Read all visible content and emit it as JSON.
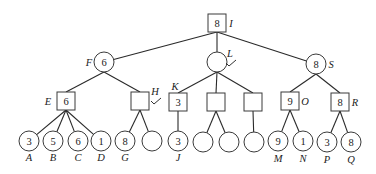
{
  "diagram": {
    "type": "game-tree",
    "edges": [
      [
        "I",
        "F"
      ],
      [
        "I",
        "L"
      ],
      [
        "I",
        "S"
      ],
      [
        "F",
        "E"
      ],
      [
        "F",
        "H"
      ],
      [
        "L",
        "K"
      ],
      [
        "L",
        "L2"
      ],
      [
        "L",
        "L3"
      ],
      [
        "S",
        "O"
      ],
      [
        "S",
        "R"
      ],
      [
        "E",
        "A"
      ],
      [
        "E",
        "B"
      ],
      [
        "E",
        "C"
      ],
      [
        "E",
        "D"
      ],
      [
        "H",
        "G"
      ],
      [
        "H",
        "H2"
      ],
      [
        "K",
        "J"
      ],
      [
        "L2",
        "L2a"
      ],
      [
        "L2",
        "L2b"
      ],
      [
        "L3",
        "L3a"
      ],
      [
        "O",
        "M"
      ],
      [
        "O",
        "N"
      ],
      [
        "R",
        "P"
      ],
      [
        "R",
        "Q"
      ]
    ],
    "nodes": {
      "I": {
        "shape": "square",
        "x": 217,
        "y": 23,
        "value": "8",
        "label": "I",
        "label_dx": 14,
        "label_dy": 0
      },
      "F": {
        "shape": "circle",
        "x": 104,
        "y": 62,
        "value": "6",
        "label": "F",
        "label_dx": -15,
        "label_dy": 0
      },
      "L": {
        "shape": "circle",
        "x": 217,
        "y": 62,
        "value": "",
        "label": "L",
        "label_dx": 13,
        "label_dy": -9,
        "check": true
      },
      "S": {
        "shape": "circle",
        "x": 316,
        "y": 64,
        "value": "8",
        "label": "S",
        "label_dx": 15,
        "label_dy": 0
      },
      "E": {
        "shape": "square",
        "x": 66,
        "y": 101,
        "value": "6",
        "label": "E",
        "label_dx": -18,
        "label_dy": 0
      },
      "H": {
        "shape": "square",
        "x": 140,
        "y": 101,
        "value": "",
        "label": "H",
        "label_dx": 15,
        "label_dy": -10,
        "check": true
      },
      "K": {
        "shape": "square",
        "x": 178,
        "y": 102,
        "value": "3",
        "label": "K",
        "label_dx": -3,
        "label_dy": -16
      },
      "L2": {
        "shape": "square",
        "x": 216,
        "y": 102,
        "value": "",
        "label": ""
      },
      "L3": {
        "shape": "square",
        "x": 253,
        "y": 102,
        "value": "",
        "label": ""
      },
      "O": {
        "shape": "square",
        "x": 290,
        "y": 101,
        "value": "9",
        "label": "O",
        "label_dx": 15,
        "label_dy": 0
      },
      "R": {
        "shape": "square",
        "x": 340,
        "y": 102,
        "value": "8",
        "label": "R",
        "label_dx": 15,
        "label_dy": 0
      },
      "A": {
        "shape": "circle",
        "x": 29,
        "y": 141,
        "value": "3",
        "label": "A",
        "label_dx": 0,
        "label_dy": 16
      },
      "B": {
        "shape": "circle",
        "x": 53,
        "y": 141,
        "value": "5",
        "label": "B",
        "label_dx": 0,
        "label_dy": 16
      },
      "C": {
        "shape": "circle",
        "x": 78,
        "y": 141,
        "value": "6",
        "label": "C",
        "label_dx": 0,
        "label_dy": 16
      },
      "D": {
        "shape": "circle",
        "x": 101,
        "y": 141,
        "value": "1",
        "label": "D",
        "label_dx": 0,
        "label_dy": 16
      },
      "G": {
        "shape": "circle",
        "x": 125,
        "y": 141,
        "value": "8",
        "label": "G",
        "label_dx": 0,
        "label_dy": 16
      },
      "H2": {
        "shape": "circle",
        "x": 152,
        "y": 141,
        "value": "",
        "label": ""
      },
      "J": {
        "shape": "circle",
        "x": 178,
        "y": 141,
        "value": "3",
        "label": "J",
        "label_dx": 0,
        "label_dy": 16
      },
      "L2a": {
        "shape": "circle",
        "x": 203,
        "y": 142,
        "value": "",
        "label": ""
      },
      "L2b": {
        "shape": "circle",
        "x": 229,
        "y": 142,
        "value": "",
        "label": ""
      },
      "L3a": {
        "shape": "circle",
        "x": 254,
        "y": 142,
        "value": "",
        "label": ""
      },
      "M": {
        "shape": "circle",
        "x": 278,
        "y": 141,
        "value": "9",
        "label": "M",
        "label_dx": 0,
        "label_dy": 17
      },
      "N": {
        "shape": "circle",
        "x": 303,
        "y": 141,
        "value": "1",
        "label": "N",
        "label_dx": 0,
        "label_dy": 17
      },
      "P": {
        "shape": "circle",
        "x": 327,
        "y": 142,
        "value": "3",
        "label": "P",
        "label_dx": 0,
        "label_dy": 17
      },
      "Q": {
        "shape": "circle",
        "x": 351,
        "y": 142,
        "value": "8",
        "label": "Q",
        "label_dx": 0,
        "label_dy": 17
      }
    }
  },
  "text": {
    "I_value": "8",
    "I_label": "I",
    "F_value": "6",
    "F_label": "F",
    "L_label": "L",
    "S_value": "8",
    "S_label": "S",
    "E_value": "6",
    "E_label": "E",
    "H_label": "H",
    "K_value": "3",
    "K_label": "K",
    "O_value": "9",
    "O_label": "O",
    "R_value": "8",
    "R_label": "R",
    "A_value": "3",
    "A_label": "A",
    "B_value": "5",
    "B_label": "B",
    "C_value": "6",
    "C_label": "C",
    "D_value": "1",
    "D_label": "D",
    "G_value": "8",
    "G_label": "G",
    "J_value": "3",
    "J_label": "J",
    "M_value": "9",
    "M_label": "M",
    "N_value": "1",
    "N_label": "N",
    "P_value": "3",
    "P_label": "P",
    "Q_value": "8",
    "Q_label": "Q"
  }
}
